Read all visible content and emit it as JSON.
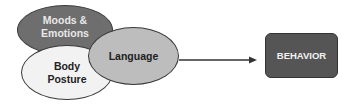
{
  "diagram": {
    "inputs": [
      {
        "id": "moods",
        "label_line1": "Moods &",
        "label_line2": "Emotions",
        "fill": "#6e6e6e"
      },
      {
        "id": "body",
        "label_line1": "Body",
        "label_line2": "Posture",
        "fill": "#f2f2f2"
      },
      {
        "id": "language",
        "label": "Language",
        "fill": "#bdbdbd"
      }
    ],
    "output": {
      "label": "BEHAVIOR",
      "fill": "#555555"
    },
    "edges": [
      {
        "from": "inputs",
        "to": "BEHAVIOR",
        "type": "arrow"
      }
    ]
  }
}
